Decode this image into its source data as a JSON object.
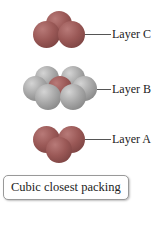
{
  "diagram": {
    "title": "Cubic closest packing",
    "layers": [
      {
        "label": "Layer C",
        "sphere_count": 3,
        "color": "#9a5856"
      },
      {
        "label": "Layer B",
        "sphere_count": 7,
        "color": "#a8a8a8"
      },
      {
        "label": "Layer A",
        "sphere_count": 3,
        "color": "#9a5856"
      }
    ]
  }
}
